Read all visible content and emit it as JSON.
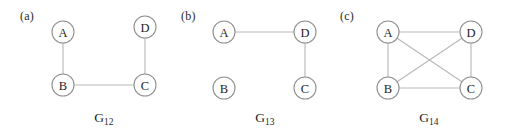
{
  "figure": {
    "width": 511,
    "height": 136,
    "background": "#ffffff",
    "node_stroke": "#8f8f8f",
    "node_fill": "#ffffff",
    "edge_color": "#b9b9b9",
    "label_color": "#1f1f1f",
    "node_radius": 11
  },
  "panels": [
    {
      "key": "a",
      "panel_label": "(a)",
      "panel_label_x": 20,
      "panel_label_y": 9,
      "caption_name": "G",
      "caption_subscript": "12",
      "caption_x": 104,
      "caption_y": 110,
      "nodes": [
        {
          "id": "A",
          "label": "A",
          "x": 63,
          "y": 32
        },
        {
          "id": "D",
          "label": "D",
          "x": 145,
          "y": 27
        },
        {
          "id": "B",
          "label": "B",
          "x": 63,
          "y": 85
        },
        {
          "id": "C",
          "label": "C",
          "x": 145,
          "y": 85
        }
      ],
      "edges": [
        {
          "from": "A",
          "to": "B"
        },
        {
          "from": "B",
          "to": "C"
        },
        {
          "from": "C",
          "to": "D"
        }
      ]
    },
    {
      "key": "b",
      "panel_label": "(b)",
      "panel_label_x": 181,
      "panel_label_y": 9,
      "caption_name": "G",
      "caption_subscript": "13",
      "caption_x": 265,
      "caption_y": 110,
      "nodes": [
        {
          "id": "A",
          "label": "A",
          "x": 224,
          "y": 32
        },
        {
          "id": "D",
          "label": "D",
          "x": 305,
          "y": 32
        },
        {
          "id": "B",
          "label": "B",
          "x": 224,
          "y": 88
        },
        {
          "id": "C",
          "label": "C",
          "x": 305,
          "y": 88
        }
      ],
      "edges": [
        {
          "from": "A",
          "to": "D"
        },
        {
          "from": "D",
          "to": "C"
        }
      ]
    },
    {
      "key": "c",
      "panel_label": "(c)",
      "panel_label_x": 340,
      "panel_label_y": 9,
      "caption_name": "G",
      "caption_subscript": "14",
      "caption_x": 429,
      "caption_y": 110,
      "nodes": [
        {
          "id": "A",
          "label": "A",
          "x": 388,
          "y": 32
        },
        {
          "id": "D",
          "label": "D",
          "x": 471,
          "y": 32
        },
        {
          "id": "B",
          "label": "B",
          "x": 388,
          "y": 88
        },
        {
          "id": "C",
          "label": "C",
          "x": 471,
          "y": 88
        }
      ],
      "edges": [
        {
          "from": "A",
          "to": "D"
        },
        {
          "from": "A",
          "to": "B"
        },
        {
          "from": "A",
          "to": "C"
        },
        {
          "from": "B",
          "to": "D"
        },
        {
          "from": "B",
          "to": "C"
        },
        {
          "from": "D",
          "to": "C"
        }
      ]
    }
  ]
}
